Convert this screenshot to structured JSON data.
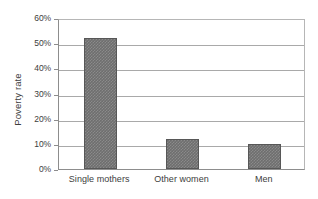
{
  "chart_data": {
    "type": "bar",
    "title": "",
    "xlabel": "",
    "ylabel": "Poverty rate",
    "categories": [
      "Single mothers",
      "Other women",
      "Men"
    ],
    "values": [
      52,
      12,
      10
    ],
    "value_unit": "%",
    "ylim": [
      0,
      60
    ],
    "ytick_labels": [
      "0%",
      "10%",
      "20%",
      "30%",
      "40%",
      "50%",
      "60%"
    ],
    "ytick_values": [
      0,
      10,
      20,
      30,
      40,
      50,
      60
    ],
    "grid": true,
    "legend": "none",
    "series": [
      {
        "name": "Poverty rate",
        "values": [
          52,
          12,
          10
        ]
      }
    ],
    "colors": {
      "bar_fill": "#6e6e6e",
      "bar_border": "#575757",
      "gridline": "#a9a9a9",
      "axis": "#8d8d8d",
      "text": "#3d3d3d",
      "background": "#ffffff"
    }
  }
}
